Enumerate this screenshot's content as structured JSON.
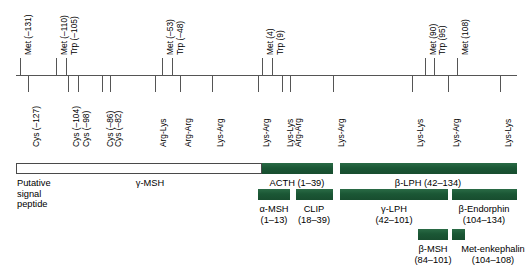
{
  "figure": {
    "axis": {
      "color": "#555555"
    },
    "bar_color_green": "#1d5c39",
    "bar_color_hollow": "#ffffff"
  },
  "residues_above": [
    {
      "label": "Met (–131)",
      "x": 20
    },
    {
      "label": "Met (–110)",
      "x": 56
    },
    {
      "label": "Trp (–105)",
      "x": 66
    },
    {
      "label": "Met (–53)",
      "x": 162
    },
    {
      "label": "Trp (–48)",
      "x": 172
    },
    {
      "label": "Met (4)",
      "x": 262
    },
    {
      "label": "Trp (9)",
      "x": 272
    },
    {
      "label": "Met (90)",
      "x": 425
    },
    {
      "label": "Trp (95)",
      "x": 434
    },
    {
      "label": "Met (108)",
      "x": 457
    }
  ],
  "residues_below": [
    {
      "label": "Cys (–127)",
      "x": 28
    },
    {
      "label": "Cys (–104)",
      "x": 68
    },
    {
      "label": "Cys (–98)",
      "x": 78
    },
    {
      "label": "Cys (–86)",
      "x": 102
    },
    {
      "label": "Cys (–82)",
      "x": 110
    },
    {
      "label": "Arg-Lys",
      "x": 155
    },
    {
      "label": "Arg-Arg",
      "x": 180
    },
    {
      "label": "Lys-Arg",
      "x": 212
    },
    {
      "label": "Lys-Arg",
      "x": 258
    },
    {
      "label": "Lys-Lys",
      "x": 282
    },
    {
      "label": "Arg-Arg",
      "x": 290
    },
    {
      "label": "Lys-Arg",
      "x": 333
    },
    {
      "label": "Lys-Lys",
      "x": 412
    },
    {
      "label": "Lys-Arg",
      "x": 448
    },
    {
      "label": "Lys-Lys",
      "x": 500
    }
  ],
  "domains": {
    "row1": [
      {
        "name": "signal-peptide",
        "style": "hollow",
        "x": 16,
        "w": 246,
        "label_lines": [
          "Putative",
          "signal",
          "peptide"
        ],
        "label_align": "left",
        "label_x": 17,
        "label_y": 178
      },
      {
        "name": "gamma-msh",
        "style": "hollow-inner",
        "label_lines": [
          "γ-MSH"
        ],
        "label_align": "center",
        "label_x": 150,
        "label_y": 178
      },
      {
        "name": "acth",
        "style": "green",
        "x": 262,
        "w": 71,
        "label_lines": [
          "ACTH (1–39)"
        ],
        "label_align": "center",
        "label_x": 297,
        "label_y": 178
      },
      {
        "name": "beta-lph",
        "style": "green",
        "x": 340,
        "w": 177,
        "label_lines": [
          "β-LPH (42–134)"
        ],
        "label_align": "center",
        "label_x": 428,
        "label_y": 178
      }
    ],
    "row2": [
      {
        "name": "alpha-msh",
        "style": "green",
        "x": 258,
        "w": 32,
        "label_lines": [
          "α-MSH",
          "(1–13)"
        ],
        "label_x": 274,
        "label_y": 204
      },
      {
        "name": "clip",
        "style": "green",
        "x": 296,
        "w": 37,
        "label_lines": [
          "CLIP",
          "(18–39)"
        ],
        "label_x": 314,
        "label_y": 204
      },
      {
        "name": "gamma-lph",
        "style": "green",
        "x": 340,
        "w": 108,
        "label_lines": [
          "γ-LPH",
          "(42–101)"
        ],
        "label_x": 394,
        "label_y": 204
      },
      {
        "name": "beta-endorphin",
        "style": "green",
        "x": 452,
        "w": 65,
        "label_lines": [
          "β-Endorphin",
          "(104–134)"
        ],
        "label_x": 484,
        "label_y": 204
      }
    ],
    "row3": [
      {
        "name": "beta-msh",
        "style": "green",
        "x": 418,
        "w": 30,
        "label_lines": [
          "β-MSH",
          "(84–101)"
        ],
        "label_x": 433,
        "label_y": 244
      },
      {
        "name": "met-enkephalin",
        "style": "green",
        "x": 452,
        "w": 13,
        "label_lines": [
          "Met-enkephalin",
          "(104–108)"
        ],
        "label_x": 493,
        "label_y": 244
      }
    ]
  },
  "gamma_msh_label": "γ-MSH"
}
